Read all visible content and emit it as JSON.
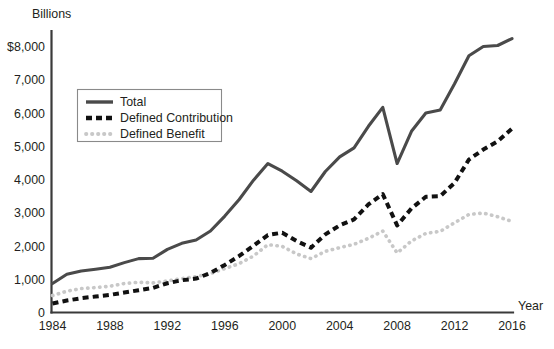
{
  "chart_data": {
    "type": "line",
    "title": "",
    "unit_label": "Billions",
    "xlabel": "Year",
    "ylabel": "",
    "x": [
      1984,
      1985,
      1986,
      1987,
      1988,
      1989,
      1990,
      1991,
      1992,
      1993,
      1994,
      1995,
      1996,
      1997,
      1998,
      1999,
      2000,
      2001,
      2002,
      2003,
      2004,
      2005,
      2006,
      2007,
      2008,
      2009,
      2010,
      2011,
      2012,
      2013,
      2014,
      2015,
      2016
    ],
    "xlim": [
      1984,
      2016
    ],
    "ylim": [
      0,
      8600
    ],
    "xticks": [
      1984,
      1988,
      1992,
      1996,
      2000,
      2004,
      2008,
      2012,
      2016
    ],
    "xticklabels": [
      "1984",
      "1988",
      "1992",
      "1996",
      "2000",
      "2004",
      "2008",
      "2012",
      "2016"
    ],
    "yticks": [
      0,
      1000,
      2000,
      3000,
      4000,
      5000,
      6000,
      7000,
      8000
    ],
    "yticklabels": [
      "0",
      "1,000",
      "2,000",
      "3,000",
      "4,000",
      "5,000",
      "6,000",
      "7,000",
      "$8,000"
    ],
    "grid": false,
    "legend_position": "upper-left-inset",
    "series": [
      {
        "name": "Total",
        "style": "solid",
        "color": "#4a4a4a",
        "values": [
          870,
          1150,
          1250,
          1300,
          1360,
          1500,
          1620,
          1630,
          1900,
          2080,
          2180,
          2450,
          2900,
          3400,
          3980,
          4480,
          4250,
          3960,
          3640,
          4240,
          4680,
          4950,
          5600,
          6170,
          4480,
          5450,
          6000,
          6090,
          6880,
          7720,
          8000,
          8030,
          8240
        ]
      },
      {
        "name": "Defined Contribution",
        "style": "dashed",
        "color": "#111111",
        "values": [
          270,
          360,
          430,
          480,
          530,
          600,
          670,
          740,
          880,
          970,
          1020,
          1190,
          1430,
          1700,
          2010,
          2330,
          2400,
          2150,
          1950,
          2350,
          2620,
          2800,
          3250,
          3560,
          2620,
          3130,
          3480,
          3500,
          3900,
          4600,
          4900,
          5150,
          5530
        ]
      },
      {
        "name": "Defined Benefit",
        "style": "dotted",
        "color": "#c8c8c8",
        "values": [
          510,
          640,
          720,
          750,
          790,
          870,
          910,
          890,
          950,
          1020,
          1080,
          1170,
          1320,
          1470,
          1700,
          2040,
          1990,
          1760,
          1620,
          1840,
          1950,
          2050,
          2230,
          2450,
          1790,
          2150,
          2380,
          2440,
          2700,
          2950,
          2990,
          2880,
          2740
        ]
      }
    ],
    "annotations": []
  },
  "legend": {
    "items": [
      {
        "label": "Total",
        "swatch": "solid-line-swatch"
      },
      {
        "label": "Defined Contribution",
        "swatch": "dashed-line-swatch"
      },
      {
        "label": "Defined Benefit",
        "swatch": "dotted-line-swatch"
      }
    ]
  }
}
